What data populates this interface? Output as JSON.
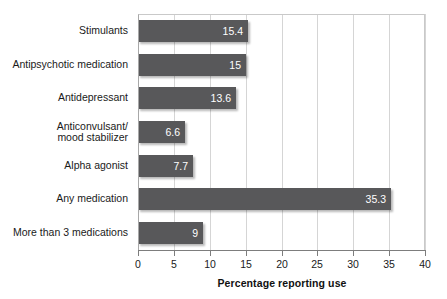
{
  "chart_data": {
    "type": "bar",
    "orientation": "horizontal",
    "title": "",
    "xlabel": "Percentage reporting use",
    "ylabel": "",
    "xlim": [
      0,
      40
    ],
    "xticks": [
      0,
      5,
      10,
      15,
      20,
      25,
      30,
      35,
      40
    ],
    "xtick_labels": [
      "0",
      "5",
      "10",
      "15",
      "20",
      "25",
      "30",
      "35",
      "40"
    ],
    "grid": "vertical",
    "legend": "none",
    "bar_color": "#58585a",
    "value_label_color": "#ffffff",
    "gridline_color": "#d5d5d5",
    "categories": [
      "Stimulants",
      "Antipsychotic medication",
      "Antidepressant",
      "Anticonvulsant/\nmood stabilizer",
      "Alpha agonist",
      "Any medication",
      "More than 3 medications"
    ],
    "values": [
      15.4,
      15,
      13.6,
      6.6,
      7.7,
      35.3,
      9
    ],
    "value_labels": [
      "15.4",
      "15",
      "13.6",
      "6.6",
      "7.7",
      "35.3",
      "9"
    ]
  }
}
